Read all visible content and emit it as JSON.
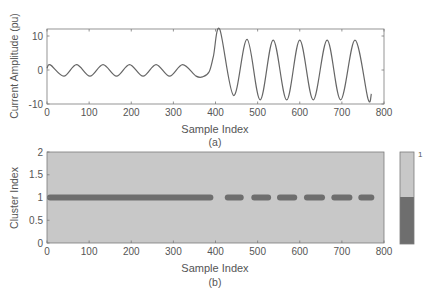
{
  "figure": {
    "width": 434,
    "height": 301
  },
  "colors": {
    "axis": "#7a7a7a",
    "text": "#555555",
    "waveform": "#666666",
    "cluster_bg": "#c8c8c8",
    "cluster_active": "#6e6e6e",
    "colorbar_top": "#c8c8c8",
    "colorbar_bottom": "#6e6e6e"
  },
  "chart_data": [
    {
      "id": "a",
      "type": "line",
      "caption": "(a)",
      "title": "",
      "xlabel": "Sample Index",
      "ylabel": "Current Amplitude (pu)",
      "xlim": [
        0,
        800
      ],
      "ylim": [
        -10,
        12
      ],
      "xticks": [
        0,
        100,
        200,
        300,
        400,
        500,
        600,
        700,
        800
      ],
      "yticks": [
        -10,
        0,
        10
      ],
      "grid": false,
      "series": [
        {
          "name": "current",
          "description": "Pre-fault sinusoid ~±2 pu with period ~63 samples; at ~395 amplitude jumps to ~±9 pu (first peak ~12 at ~410)",
          "x": [
            0,
            8,
            40,
            70,
            102,
            133,
            165,
            196,
            228,
            259,
            291,
            322,
            354,
            370,
            385,
            395,
            410,
            443,
            475,
            506,
            537,
            569,
            600,
            632,
            665,
            697,
            731,
            762,
            770
          ],
          "y": [
            0.5,
            1.5,
            -1.8,
            1.6,
            -1.8,
            1.6,
            -1.8,
            1.6,
            -1.8,
            1.6,
            -1.8,
            1.6,
            -1.8,
            -2.0,
            -0.5,
            4.0,
            12.0,
            -7.5,
            9.0,
            -8.8,
            8.8,
            -8.8,
            8.8,
            -8.8,
            8.8,
            -8.8,
            8.8,
            -8.5,
            -7.0
          ]
        }
      ]
    },
    {
      "id": "b",
      "type": "heatmap",
      "caption": "(b)",
      "title": "",
      "xlabel": "Sample Index",
      "ylabel": "Cluster Index",
      "xlim": [
        0,
        800
      ],
      "ylim": [
        0,
        2
      ],
      "xticks": [
        0,
        100,
        200,
        300,
        400,
        500,
        600,
        700,
        800
      ],
      "yticks": [
        0,
        0.5,
        1,
        1.5,
        2
      ],
      "ytick_labels": [
        "0",
        "0.5",
        "1",
        "1.5",
        "2"
      ],
      "grid": false,
      "cluster_row": 1,
      "active_segments": [
        [
          0,
          395
        ],
        [
          422,
          467
        ],
        [
          485,
          532
        ],
        [
          546,
          594
        ],
        [
          610,
          660
        ],
        [
          675,
          725
        ],
        [
          739,
          777
        ]
      ],
      "colorbar": {
        "label_top": "1",
        "levels": [
          0,
          1
        ]
      }
    }
  ]
}
